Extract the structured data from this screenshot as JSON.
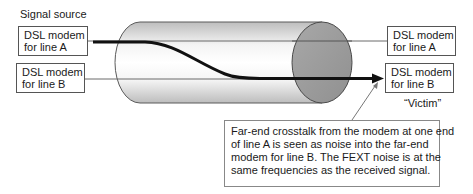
{
  "labels": {
    "signal_source": "Signal source",
    "victim": "“Victim”"
  },
  "modems": {
    "left_a": {
      "line1": "DSL modem",
      "line2": "for line A"
    },
    "left_b": {
      "line1": "DSL modem",
      "line2": "for line B"
    },
    "right_a": {
      "line1": "DSL modem",
      "line2": "for line A"
    },
    "right_b": {
      "line1": "DSL modem",
      "line2": "for line B"
    }
  },
  "callout": {
    "lines": [
      "Far-end crosstalk from the modem at one end",
      "of line A is seen as noise into the far-end",
      "modem for line B.  The FEXT noise is at the",
      "same frequencies as the received signal."
    ]
  },
  "colors": {
    "cable_body_edge": "#c4c4c4",
    "cable_body_center": "#ffffff",
    "cable_end": "#9c9c9c",
    "signal_path": "#111111",
    "wire": "#6a6a6a"
  }
}
